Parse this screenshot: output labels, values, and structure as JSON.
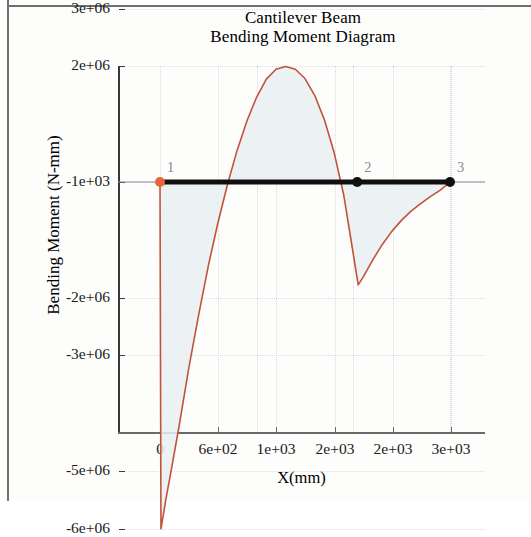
{
  "figure": {
    "title_line1": "Cantilever Beam",
    "title_line2": "Bending Moment Diagram"
  },
  "chart_data": {
    "type": "line",
    "title": "Cantilever Beam\nBending Moment Diagram",
    "xlabel": "X(mm)",
    "ylabel": "Bending Moment (N-mm)",
    "grid": true,
    "legend": null,
    "xlim": [
      0,
      3050
    ],
    "ylim": [
      -6300000,
      3000000
    ],
    "xticks": [
      0,
      600,
      1000,
      2000,
      2000,
      3000
    ],
    "xtick_labels": [
      "0",
      "6e+02",
      "1e+03",
      "2e+03",
      "2e+03",
      "3e+03"
    ],
    "yticks": [
      3000000,
      2000000,
      -1000,
      -2000000,
      -3000000,
      -5000000,
      -6000000
    ],
    "ytick_labels": [
      "3e+06",
      "2e+06",
      "-1e+03",
      "-2e+06",
      "-3e+06",
      "-5e+06",
      "-6e+06"
    ],
    "series": [
      {
        "name": "Bending Moment",
        "color": "#c0543a",
        "fill": "#e9eef1",
        "x": [
          0,
          10,
          60,
          120,
          200,
          300,
          400,
          500,
          600,
          700,
          800,
          900,
          1000,
          1100,
          1200,
          1300,
          1400,
          1500,
          1600,
          1700,
          1800,
          1900,
          2000,
          2050,
          2100,
          2200,
          2300,
          2400,
          2500,
          2600,
          2700,
          2800,
          2900,
          3000
        ],
        "y": [
          0,
          -6000000,
          -5500000,
          -4950000,
          -4200000,
          -3200000,
          -2300000,
          -1450000,
          -700000,
          -30000,
          560000,
          1060000,
          1470000,
          1780000,
          1950000,
          2000000,
          1950000,
          1790000,
          1500000,
          1080000,
          520000,
          -220000,
          -1250000,
          -1780000,
          -1650000,
          -1350000,
          -1080000,
          -850000,
          -660000,
          -500000,
          -370000,
          -250000,
          -140000,
          0
        ]
      }
    ],
    "beam": {
      "name": "Beam",
      "color": "#101010",
      "y": 0,
      "x_start": 0,
      "x_end": 3000
    },
    "nodes": [
      {
        "label": "1",
        "x": 0,
        "y": 0,
        "color": "#e8663c"
      },
      {
        "label": "2",
        "x": 2040,
        "y": 0,
        "color": "#101010"
      },
      {
        "label": "3",
        "x": 3000,
        "y": 0,
        "color": "#101010"
      }
    ],
    "zero_line": {
      "color": "#8c8c8c",
      "y": 0
    }
  }
}
